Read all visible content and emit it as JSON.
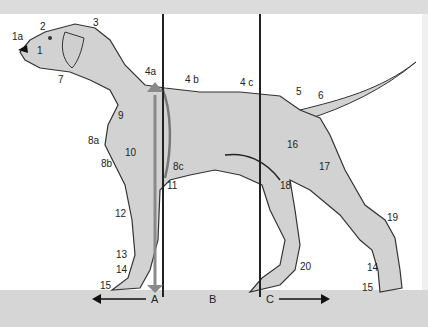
{
  "figure": {
    "colors": {
      "body_fill": "#d2d2d2",
      "outline": "#333333",
      "ground": "#d6d6d6",
      "arrow_gray": "#8a8a8a",
      "line": "#222222"
    }
  },
  "labels": [
    {
      "id": "1a",
      "text": "1a",
      "x": 12,
      "y": 32
    },
    {
      "id": "2",
      "text": "2",
      "x": 40,
      "y": 22
    },
    {
      "id": "3",
      "text": "3",
      "x": 93,
      "y": 18
    },
    {
      "id": "1",
      "text": "1",
      "x": 37,
      "y": 46
    },
    {
      "id": "7",
      "text": "7",
      "x": 58,
      "y": 75
    },
    {
      "id": "4a",
      "text": "4a",
      "x": 145,
      "y": 67
    },
    {
      "id": "4b",
      "text": "4 b",
      "x": 185,
      "y": 75
    },
    {
      "id": "4c",
      "text": "4 c",
      "x": 240,
      "y": 78
    },
    {
      "id": "5",
      "text": "5",
      "x": 296,
      "y": 87
    },
    {
      "id": "6",
      "text": "6",
      "x": 318,
      "y": 91
    },
    {
      "id": "9",
      "text": "9",
      "x": 118,
      "y": 111
    },
    {
      "id": "8a",
      "text": "8a",
      "x": 88,
      "y": 136
    },
    {
      "id": "10",
      "text": "10",
      "x": 125,
      "y": 148
    },
    {
      "id": "8b",
      "text": "8b",
      "x": 101,
      "y": 159
    },
    {
      "id": "8c",
      "text": "8c",
      "x": 173,
      "y": 162
    },
    {
      "id": "11",
      "text": "11",
      "x": 167,
      "y": 181
    },
    {
      "id": "16",
      "text": "16",
      "x": 287,
      "y": 140
    },
    {
      "id": "17",
      "text": "17",
      "x": 319,
      "y": 162
    },
    {
      "id": "18",
      "text": "18",
      "x": 280,
      "y": 181
    },
    {
      "id": "12",
      "text": "12",
      "x": 115,
      "y": 209
    },
    {
      "id": "19",
      "text": "19",
      "x": 387,
      "y": 213
    },
    {
      "id": "13",
      "text": "13",
      "x": 116,
      "y": 250
    },
    {
      "id": "14a",
      "text": "14",
      "x": 116,
      "y": 265
    },
    {
      "id": "20",
      "text": "20",
      "x": 300,
      "y": 262
    },
    {
      "id": "14b",
      "text": "14",
      "x": 367,
      "y": 263
    },
    {
      "id": "15a",
      "text": "15",
      "x": 100,
      "y": 281
    },
    {
      "id": "15b",
      "text": "15",
      "x": 362,
      "y": 283
    }
  ],
  "zones": [
    {
      "id": "A",
      "text": "A",
      "x": 151,
      "y": 294
    },
    {
      "id": "B",
      "text": "B",
      "x": 209,
      "y": 294
    },
    {
      "id": "C",
      "text": "C",
      "x": 266,
      "y": 294
    }
  ]
}
